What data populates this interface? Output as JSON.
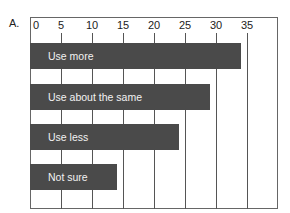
{
  "panel_label": "A.",
  "chart_data": {
    "type": "bar",
    "orientation": "horizontal",
    "title": "",
    "xlabel": "",
    "ylabel": "",
    "categories": [
      "Use more",
      "Use about the same",
      "Use less",
      "Not sure"
    ],
    "values": [
      34,
      29,
      24,
      14
    ],
    "xlim": [
      0,
      40
    ],
    "x_ticks": [
      0,
      5,
      10,
      15,
      20,
      25,
      30,
      35
    ],
    "tick_labels": [
      "0",
      "5",
      "10",
      "15",
      "20",
      "25",
      "30",
      "35"
    ],
    "axis_position": "top",
    "grid": true,
    "legend": null,
    "bar_color": "#4a4a4a",
    "label_color": "#f2f2f2",
    "labels_inside_bars": true
  }
}
